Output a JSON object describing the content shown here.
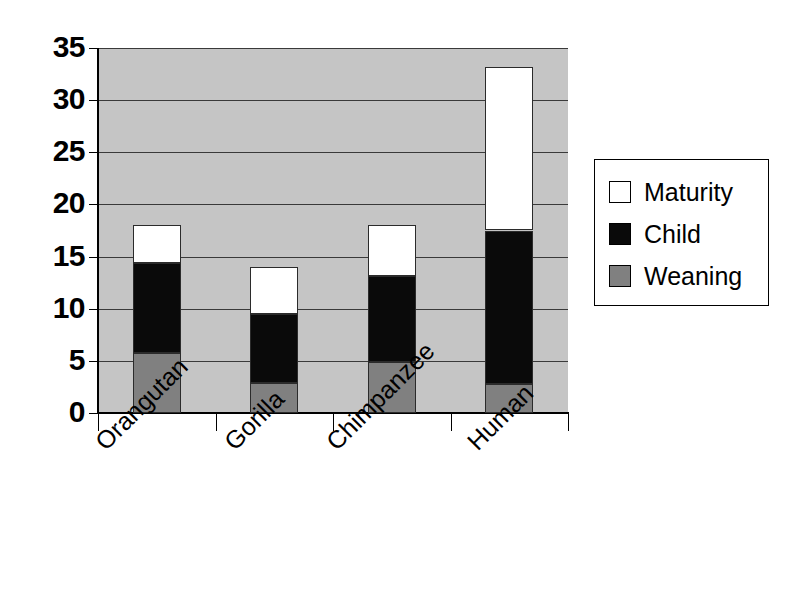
{
  "chart_data": {
    "type": "bar",
    "subtype": "stacked",
    "title": "",
    "xlabel": "",
    "ylabel": "",
    "categories": [
      "Orangutan",
      "Gorilla",
      "Chimpanzee",
      "Human"
    ],
    "series": [
      {
        "name": "Weaning",
        "color": "#808080",
        "values": [
          5.8,
          2.9,
          4.9,
          2.8
        ]
      },
      {
        "name": "Child",
        "color": "#0a0a0a",
        "values": [
          8.6,
          6.6,
          8.2,
          14.7
        ]
      },
      {
        "name": "Maturity",
        "color": "#ffffff",
        "values": [
          3.6,
          4.5,
          4.9,
          15.7
        ]
      }
    ],
    "totals": [
      18.0,
      14.0,
      18.0,
      33.2
    ],
    "ylim": [
      0,
      35
    ],
    "ytick_step": 5,
    "ytick_labels": [
      "35",
      "30",
      "25",
      "20",
      "15",
      "10",
      "5",
      "0"
    ],
    "grid": true,
    "legend_position": "right",
    "plot_background": "#c5c5c5"
  },
  "legend": {
    "items": [
      {
        "label": "Maturity",
        "color": "#ffffff"
      },
      {
        "label": "Child",
        "color": "#0a0a0a"
      },
      {
        "label": "Weaning",
        "color": "#808080"
      }
    ]
  }
}
